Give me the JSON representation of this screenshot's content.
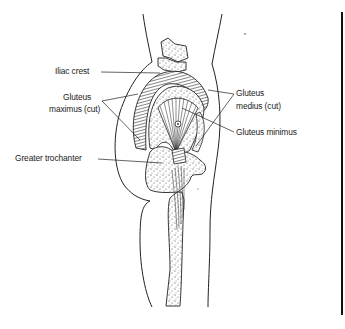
{
  "diagram": {
    "labels": {
      "iliac_crest": "Iliac crest",
      "gluteus_maximus_line1": "Gluteus",
      "gluteus_maximus_line2": "maximus (cut)",
      "gluteus_medius_line1": "Gluteus",
      "gluteus_medius_line2": "medius (cut)",
      "gluteus_minimus": "Gluteus minimus",
      "greater_trochanter": "Greater trochanter"
    },
    "colors": {
      "ink": "#222222",
      "background": "#ffffff",
      "frame": "#111111"
    }
  }
}
